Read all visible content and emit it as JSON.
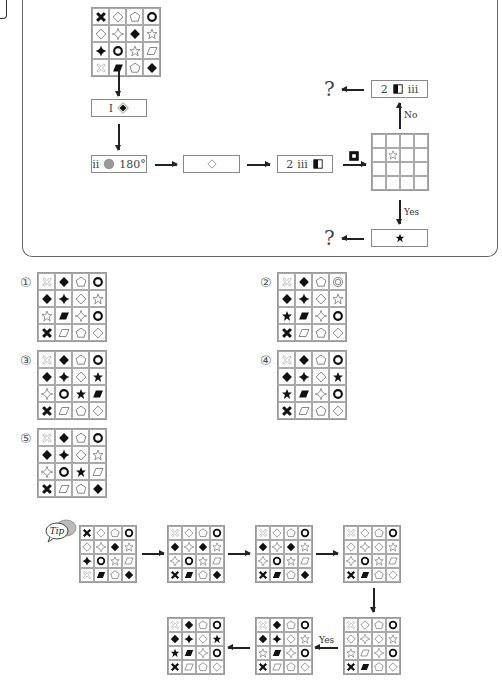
{
  "flowchart": {
    "start_grid": [
      [
        "x-black",
        "diamond-outline",
        "pentagon-outline",
        "ring-bold"
      ],
      [
        "diamond-outline",
        "sparkle-outline",
        "diamond-black",
        "star-outline"
      ],
      [
        "cross-black",
        "ring-bold",
        "star-outline",
        "parallelogram-outline"
      ],
      [
        "x-outline",
        "parallelogram-black",
        "pentagon-outline",
        "diamond-black"
      ]
    ],
    "step1": {
      "label": "I",
      "symbol": "diamond-black-in-outline"
    },
    "step2": {
      "label": "ii",
      "symbol": "circle-gray",
      "angle": "180°"
    },
    "step3": {
      "symbol": "diamond-outline"
    },
    "step4": {
      "label_num": "2",
      "label_roman": "iii",
      "symbol": "half-filled-square"
    },
    "condition_symbol": "square-hollow-bold",
    "check_grid": [
      [
        "",
        "",
        "",
        ""
      ],
      [
        "",
        "star-outline",
        "",
        ""
      ],
      [
        "",
        "",
        "",
        ""
      ],
      [
        "",
        "",
        "",
        ""
      ]
    ],
    "no_branch": {
      "label": "No",
      "box_num": "2",
      "box_symbol": "half-filled-square",
      "box_roman": "iii",
      "result": "?"
    },
    "yes_branch": {
      "label": "Yes",
      "box_symbol": "star-black",
      "result": "?"
    }
  },
  "options": [
    {
      "number": "①",
      "grid": [
        [
          "x-outline",
          "diamond-black",
          "pentagon-outline",
          "ring-bold"
        ],
        [
          "diamond-black",
          "cross-black",
          "diamond-outline",
          "star-outline"
        ],
        [
          "star-outline",
          "parallelogram-black",
          "sparkle-outline",
          "ring-bold"
        ],
        [
          "x-black",
          "parallelogram-outline",
          "pentagon-outline",
          "diamond-outline"
        ]
      ]
    },
    {
      "number": "②",
      "grid": [
        [
          "x-outline",
          "diamond-black",
          "pentagon-outline",
          "ring-double"
        ],
        [
          "diamond-black",
          "cross-black",
          "diamond-outline",
          "star-outline"
        ],
        [
          "star-black",
          "parallelogram-black",
          "sparkle-outline",
          "ring-bold"
        ],
        [
          "x-black",
          "parallelogram-outline",
          "pentagon-outline",
          "diamond-outline"
        ]
      ]
    },
    {
      "number": "③",
      "grid": [
        [
          "x-outline",
          "diamond-black",
          "pentagon-outline",
          "ring-bold"
        ],
        [
          "diamond-black",
          "cross-black",
          "diamond-outline",
          "star-black"
        ],
        [
          "sparkle-outline",
          "ring-bold",
          "star-black",
          "parallelogram-black"
        ],
        [
          "x-black",
          "parallelogram-outline",
          "pentagon-outline",
          "diamond-outline"
        ]
      ]
    },
    {
      "number": "④",
      "grid": [
        [
          "x-outline",
          "diamond-black",
          "pentagon-outline",
          "ring-bold"
        ],
        [
          "diamond-black",
          "cross-black",
          "diamond-outline",
          "star-black"
        ],
        [
          "star-black",
          "parallelogram-black",
          "sparkle-outline",
          "ring-bold"
        ],
        [
          "x-black",
          "parallelogram-outline",
          "pentagon-outline",
          "diamond-outline"
        ]
      ]
    },
    {
      "number": "⑤",
      "grid": [
        [
          "x-outline",
          "diamond-black",
          "pentagon-outline",
          "ring-bold"
        ],
        [
          "diamond-black",
          "cross-black",
          "diamond-outline",
          "star-outline"
        ],
        [
          "sparkle-outline",
          "ring-bold",
          "star-black",
          "parallelogram-outline"
        ],
        [
          "x-black",
          "parallelogram-outline",
          "pentagon-outline",
          "diamond-black"
        ]
      ]
    }
  ],
  "tip": {
    "icon_label": "Tip",
    "yes_label": "Yes",
    "grids": [
      [
        [
          "x-black",
          "diamond-outline",
          "pentagon-outline",
          "ring-bold"
        ],
        [
          "diamond-outline",
          "sparkle-outline",
          "diamond-black",
          "star-outline"
        ],
        [
          "cross-black",
          "ring-bold",
          "star-outline",
          "parallelogram-outline"
        ],
        [
          "x-outline",
          "parallelogram-black",
          "pentagon-outline",
          "diamond-black"
        ]
      ],
      [
        [
          "x-outline",
          "diamond-outline",
          "pentagon-outline",
          "ring-bold"
        ],
        [
          "diamond-black",
          "sparkle-outline",
          "diamond-black",
          "star-outline"
        ],
        [
          "sparkle-outline",
          "ring-bold",
          "star-outline",
          "parallelogram-outline"
        ],
        [
          "x-black",
          "parallelogram-black",
          "pentagon-outline",
          "diamond-black"
        ]
      ],
      [
        [
          "x-outline",
          "diamond-outline",
          "pentagon-outline",
          "ring-bold"
        ],
        [
          "diamond-black",
          "sparkle-outline",
          "diamond-black",
          "star-outline"
        ],
        [
          "sparkle-outline",
          "ring-bold",
          "star-outline",
          "parallelogram-outline"
        ],
        [
          "x-black",
          "parallelogram-black",
          "pentagon-outline",
          "diamond-black"
        ]
      ],
      [
        [
          "x-outline",
          "diamond-outline",
          "pentagon-outline",
          "ring-bold"
        ],
        [
          "diamond-outline",
          "sparkle-outline",
          "diamond-outline",
          "star-outline"
        ],
        [
          "sparkle-outline",
          "ring-bold",
          "star-outline",
          "parallelogram-outline"
        ],
        [
          "x-black",
          "parallelogram-black",
          "pentagon-outline",
          "diamond-outline"
        ]
      ],
      [
        [
          "x-outline",
          "diamond-outline",
          "pentagon-outline",
          "ring-bold"
        ],
        [
          "diamond-outline",
          "sparkle-outline",
          "diamond-outline",
          "star-outline"
        ],
        [
          "star-outline",
          "parallelogram-outline",
          "sparkle-outline",
          "ring-bold"
        ],
        [
          "x-black",
          "parallelogram-black",
          "pentagon-outline",
          "diamond-outline"
        ]
      ],
      [
        [
          "x-outline",
          "diamond-black",
          "pentagon-outline",
          "ring-bold"
        ],
        [
          "diamond-black",
          "cross-black",
          "diamond-outline",
          "star-outline"
        ],
        [
          "star-outline",
          "parallelogram-black",
          "sparkle-outline",
          "ring-bold"
        ],
        [
          "x-black",
          "parallelogram-outline",
          "pentagon-outline",
          "diamond-outline"
        ]
      ],
      [
        [
          "x-outline",
          "diamond-black",
          "pentagon-outline",
          "ring-bold"
        ],
        [
          "diamond-black",
          "cross-black",
          "diamond-outline",
          "star-black"
        ],
        [
          "star-black",
          "parallelogram-black",
          "sparkle-outline",
          "ring-bold"
        ],
        [
          "x-black",
          "parallelogram-outline",
          "pentagon-outline",
          "diamond-outline"
        ]
      ]
    ]
  }
}
